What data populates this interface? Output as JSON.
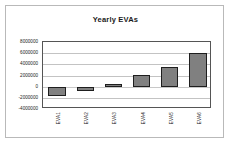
{
  "chart_data": {
    "type": "bar",
    "title": "Yearly EVAs",
    "xlabel": "",
    "ylabel": "",
    "categories": [
      "EVA1",
      "EVA2",
      "EVA3",
      "EVA4",
      "EVA5",
      "EVA6"
    ],
    "values": [
      -1700000,
      -700000,
      400000,
      2100000,
      3500000,
      6100000
    ],
    "ylim": [
      -4000000,
      8000000
    ],
    "ytick_labels": [
      "8000000",
      "6000000",
      "4000000",
      "2000000",
      "0",
      "-2000000",
      "-4000000"
    ],
    "ytick_values": [
      8000000,
      6000000,
      4000000,
      2000000,
      0,
      -2000000,
      -4000000
    ],
    "grid": true,
    "legend": "none",
    "series": [
      {
        "name": "Yearly EVAs",
        "values": [
          -1700000,
          -700000,
          400000,
          2100000,
          3500000,
          6100000
        ]
      }
    ],
    "bar_color": "#808080",
    "bar_border_color": "#1e1e1e",
    "plot_border_color": "#555555",
    "gridline_color": "#c3c3c3",
    "frame_color": "#b9b9b9",
    "background": "#ffffff"
  }
}
